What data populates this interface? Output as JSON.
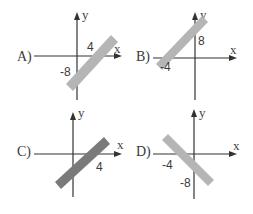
{
  "colors": {
    "axis": "#333333",
    "band_light": "#b5b5b5",
    "band_dark": "#7a7a7a",
    "text": "#3a3a3a"
  },
  "options": [
    {
      "label": "A)",
      "axis_x": "x",
      "axis_y": "y",
      "x_intercept_label": "4",
      "y_intercept_label": "-8",
      "slope": "positive",
      "band": "light"
    },
    {
      "label": "B)",
      "axis_x": "x",
      "axis_y": "y",
      "x_intercept_label": "-4",
      "y_intercept_label": "8",
      "slope": "positive",
      "band": "light"
    },
    {
      "label": "C)",
      "axis_x": "x",
      "axis_y": "y",
      "x_intercept_label": "4",
      "y_intercept_label": "",
      "slope": "positive",
      "band": "dark"
    },
    {
      "label": "D)",
      "axis_x": "x",
      "axis_y": "y",
      "x_intercept_label": "-4",
      "y_intercept_label": "-8",
      "slope": "negative",
      "band": "light"
    }
  ]
}
